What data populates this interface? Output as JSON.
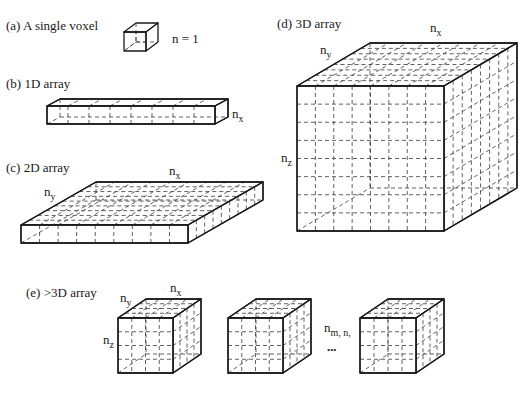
{
  "figure": {
    "panels": [
      {
        "id": "a",
        "label": "(a) A single voxel",
        "annotation": "n = 1"
      },
      {
        "id": "b",
        "label": "(b) 1D array",
        "dims": [
          {
            "base": "n",
            "sub": "x"
          }
        ]
      },
      {
        "id": "c",
        "label": "(c) 2D array",
        "dims": [
          {
            "base": "n",
            "sub": "x"
          },
          {
            "base": "n",
            "sub": "y"
          }
        ]
      },
      {
        "id": "d",
        "label": "(d) 3D array",
        "dims": [
          {
            "base": "n",
            "sub": "x"
          },
          {
            "base": "n",
            "sub": "y"
          },
          {
            "base": "n",
            "sub": "z"
          }
        ]
      },
      {
        "id": "e",
        "label": "(e) >3D array",
        "dims": [
          {
            "base": "n",
            "sub": "x"
          },
          {
            "base": "n",
            "sub": "y"
          },
          {
            "base": "n",
            "sub": "z"
          },
          {
            "base": "n",
            "sub": "m, n,"
          }
        ],
        "ellipsis": "•••"
      }
    ]
  },
  "labels": {
    "a": "(a) A single voxel",
    "a_n": "n = 1",
    "b": "(b) 1D array",
    "c": "(c) 2D array",
    "d": "(d) 3D array",
    "e": "(e) >3D array",
    "n": "n",
    "x": "x",
    "y": "y",
    "z": "z",
    "mn": "m, n,",
    "ellipsis": "•••"
  },
  "colors": {
    "line": "#1a1a1a",
    "background": "#ffffff"
  }
}
